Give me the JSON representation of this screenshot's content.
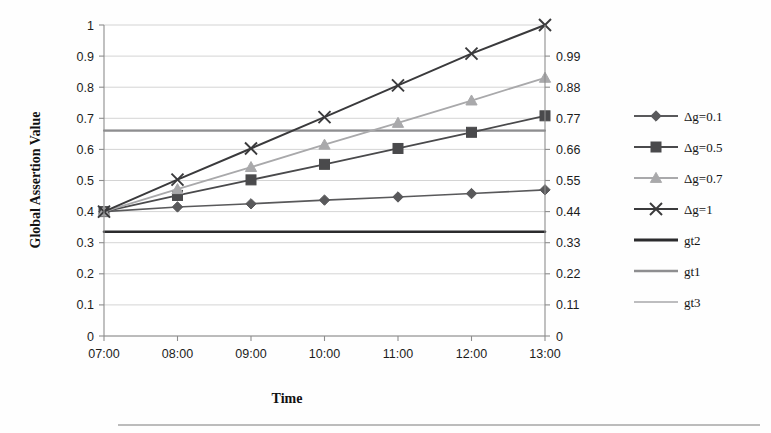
{
  "chart_data": {
    "type": "line",
    "title": "",
    "xlabel": "Time",
    "ylabel": "Global Assertion Value",
    "categories": [
      "07:00",
      "08:00",
      "09:00",
      "10:00",
      "11:00",
      "12:00",
      "13:00"
    ],
    "ylim": [
      0,
      1
    ],
    "yticks": [
      "0",
      "0.1",
      "0.2",
      "0.3",
      "0.4",
      "0.5",
      "0.6",
      "0.7",
      "0.8",
      "0.9",
      "1"
    ],
    "y2label": "",
    "y2ticks": [
      "0",
      "0.11",
      "0.22",
      "0.33",
      "0.44",
      "0.55",
      "0.66",
      "0.77",
      "0.88",
      "0.99"
    ],
    "y2lim": [
      0,
      1.1
    ],
    "grid": true,
    "legend_position": "right",
    "series": [
      {
        "name": "Δg=0.1",
        "marker": "diamond",
        "color": "#59595b",
        "width": 1.6,
        "values": [
          0.4,
          0.415,
          0.425,
          0.437,
          0.447,
          0.458,
          0.47
        ]
      },
      {
        "name": "Δg=0.5",
        "marker": "square",
        "color": "#4a4a4c",
        "width": 1.8,
        "values": [
          0.4,
          0.452,
          0.502,
          0.552,
          0.603,
          0.655,
          0.708
        ]
      },
      {
        "name": "Δg=0.7",
        "marker": "triangle",
        "color": "#a9a9ab",
        "width": 1.8,
        "values": [
          0.4,
          0.472,
          0.543,
          0.615,
          0.685,
          0.757,
          0.83
        ]
      },
      {
        "name": "Δg=1",
        "marker": "cross",
        "color": "#3a3a3c",
        "width": 2.0,
        "values": [
          0.4,
          0.503,
          0.603,
          0.704,
          0.806,
          0.908,
          1.0
        ]
      },
      {
        "name": "gt2",
        "marker": "none",
        "color": "#2b2b2d",
        "width": 2.6,
        "values": [
          0.335,
          0.335,
          0.335,
          0.335,
          0.335,
          0.335,
          0.335
        ]
      },
      {
        "name": "gt1",
        "marker": "none",
        "color": "#8e8e90",
        "width": 1.8,
        "values": [
          0.66,
          0.66,
          0.66,
          0.66,
          0.66,
          0.66,
          0.66
        ]
      },
      {
        "name": "gt3",
        "marker": "none",
        "color": "#bdbdbf",
        "width": 1.6,
        "values": [
          0.662,
          0.662,
          0.662,
          0.662,
          0.662,
          0.662,
          0.662
        ]
      }
    ]
  }
}
